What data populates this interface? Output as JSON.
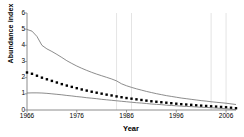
{
  "chart_data": {
    "type": "line",
    "title": "",
    "subtitle": "",
    "xlabel": "Year",
    "ylabel": "Abundance index",
    "xlim": [
      1966,
      2008
    ],
    "ylim": [
      0,
      6
    ],
    "ytick_labels": [
      "0",
      "1",
      "2",
      "3",
      "4",
      "5",
      "6"
    ],
    "ytick_values": [
      0,
      1,
      2,
      3,
      4,
      5,
      6
    ],
    "xtick_labels": [
      "1966",
      "1976",
      "1986",
      "1996",
      "2006"
    ],
    "xtick_values": [
      1966,
      1976,
      1986,
      1996,
      2006
    ],
    "grid": {
      "horizontal": false,
      "vertical": true,
      "vertical_at": [
        1984,
        1987,
        2003,
        2006
      ],
      "color": "#d8d8d8",
      "style": "solid-faint"
    },
    "legend": {
      "visible": false,
      "position": "none"
    },
    "annotations": [],
    "x": [
      1966,
      1967,
      1968,
      1969,
      1970,
      1971,
      1972,
      1973,
      1974,
      1975,
      1976,
      1977,
      1978,
      1979,
      1980,
      1981,
      1982,
      1983,
      1984,
      1985,
      1986,
      1987,
      1988,
      1989,
      1990,
      1991,
      1992,
      1993,
      1994,
      1995,
      1996,
      1997,
      1998,
      1999,
      2000,
      2001,
      2002,
      2003,
      2004,
      2005,
      2006,
      2007,
      2008
    ],
    "series": [
      {
        "name": "Upper confidence limit",
        "style": "line",
        "color": "#6e6e6e",
        "width": 0.8,
        "values": [
          4.98,
          4.88,
          4.55,
          4.0,
          3.78,
          3.62,
          3.44,
          3.25,
          3.05,
          2.88,
          2.72,
          2.58,
          2.45,
          2.33,
          2.22,
          2.12,
          2.02,
          1.92,
          1.8,
          1.62,
          1.5,
          1.4,
          1.31,
          1.23,
          1.15,
          1.08,
          1.01,
          0.95,
          0.89,
          0.84,
          0.79,
          0.74,
          0.7,
          0.66,
          0.62,
          0.58,
          0.55,
          0.51,
          0.48,
          0.45,
          0.42,
          0.38,
          0.34
        ]
      },
      {
        "name": "Abundance index estimate",
        "style": "markers-square",
        "color": "#000000",
        "marker_size": 2.4,
        "values": [
          2.32,
          2.24,
          2.12,
          2.0,
          1.9,
          1.8,
          1.7,
          1.6,
          1.51,
          1.43,
          1.35,
          1.27,
          1.2,
          1.13,
          1.07,
          1.01,
          0.95,
          0.9,
          0.84,
          0.79,
          0.74,
          0.7,
          0.66,
          0.62,
          0.58,
          0.54,
          0.51,
          0.48,
          0.45,
          0.42,
          0.39,
          0.36,
          0.34,
          0.32,
          0.29,
          0.27,
          0.25,
          0.23,
          0.21,
          0.19,
          0.17,
          0.14,
          0.11
        ]
      },
      {
        "name": "Lower confidence limit",
        "style": "line",
        "color": "#6e6e6e",
        "width": 0.8,
        "values": [
          1.05,
          1.06,
          1.06,
          1.05,
          1.03,
          1.0,
          0.97,
          0.94,
          0.9,
          0.87,
          0.83,
          0.8,
          0.76,
          0.73,
          0.7,
          0.66,
          0.63,
          0.6,
          0.57,
          0.54,
          0.51,
          0.48,
          0.45,
          0.43,
          0.4,
          0.37,
          0.35,
          0.33,
          0.3,
          0.28,
          0.26,
          0.24,
          0.22,
          0.21,
          0.19,
          0.17,
          0.16,
          0.14,
          0.12,
          0.1,
          0.08,
          0.05,
          0.02
        ]
      }
    ]
  }
}
